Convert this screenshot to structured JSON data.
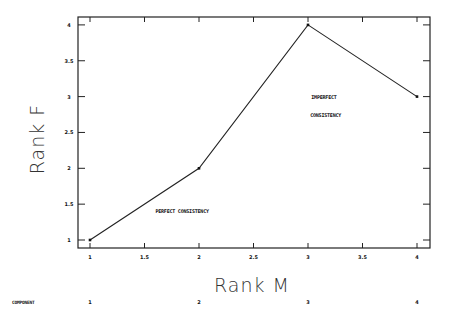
{
  "chart_data": {
    "type": "line",
    "title": "",
    "xlabel": "Rank M",
    "ylabel": "Rank F",
    "x": [
      1,
      2,
      3,
      4
    ],
    "series": [
      {
        "name": "Rank F vs Rank M",
        "values": [
          1,
          2,
          4,
          3
        ]
      }
    ],
    "xlim": [
      1,
      4
    ],
    "ylim": [
      1,
      4
    ],
    "x_ticks": [
      "1",
      "1.5",
      "2",
      "2.5",
      "3",
      "3.5",
      "4"
    ],
    "y_ticks": [
      "1",
      "1.5",
      "2",
      "2.5",
      "3",
      "3.5",
      "4"
    ],
    "grid": false,
    "legend": null,
    "annotations": [
      {
        "text": "PERFECT CONSISTENCY",
        "x": 1.6,
        "y": 1.4
      },
      {
        "text": "IMPERFECT",
        "x": 3.03,
        "y": 2.99
      },
      {
        "text": "CONSISTENCY",
        "x": 3.02,
        "y": 2.74
      }
    ],
    "component_row": {
      "label": "COMPONENT",
      "values": [
        "1",
        "2",
        "3",
        "4"
      ]
    }
  },
  "labels": {
    "xlabel": "Rank M",
    "ylabel": "Rank F",
    "annot_perfect": "PERFECT CONSISTENCY",
    "annot_imperfect_1": "IMPERFECT",
    "annot_imperfect_2": "CONSISTENCY",
    "component_label": "COMPONENT",
    "component_values": [
      "1",
      "2",
      "3",
      "4"
    ]
  }
}
